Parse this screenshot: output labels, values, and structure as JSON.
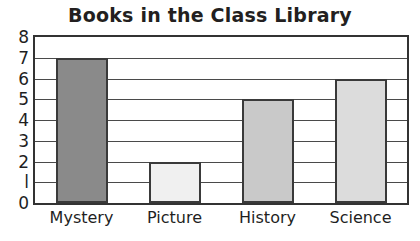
{
  "chart_data": {
    "type": "bar",
    "title": "Books in the Class Library",
    "xlabel": "",
    "ylabel": "",
    "categories": [
      "Mystery",
      "Picture",
      "History",
      "Science"
    ],
    "values": [
      7,
      2,
      5,
      6
    ],
    "ylim": [
      0,
      8
    ],
    "ytick_labels": [
      "0",
      "l",
      "2",
      "3",
      "4",
      "5",
      "6",
      "7",
      "8"
    ],
    "ytick_values": [
      0,
      1,
      2,
      3,
      4,
      5,
      6,
      7,
      8
    ],
    "grid": "horizontal",
    "legend": "none",
    "bar_colors": [
      "#8a8a8a",
      "#f0f0f0",
      "#c9c9c9",
      "#dcdcdc"
    ],
    "bar_outline_color": "#3a3a3a",
    "gridline_color": "#4a4a4a",
    "axis_color": "#333333",
    "background_color": "#ffffff",
    "text_color": "#1f1f1f",
    "title_color": "#231f20"
  }
}
